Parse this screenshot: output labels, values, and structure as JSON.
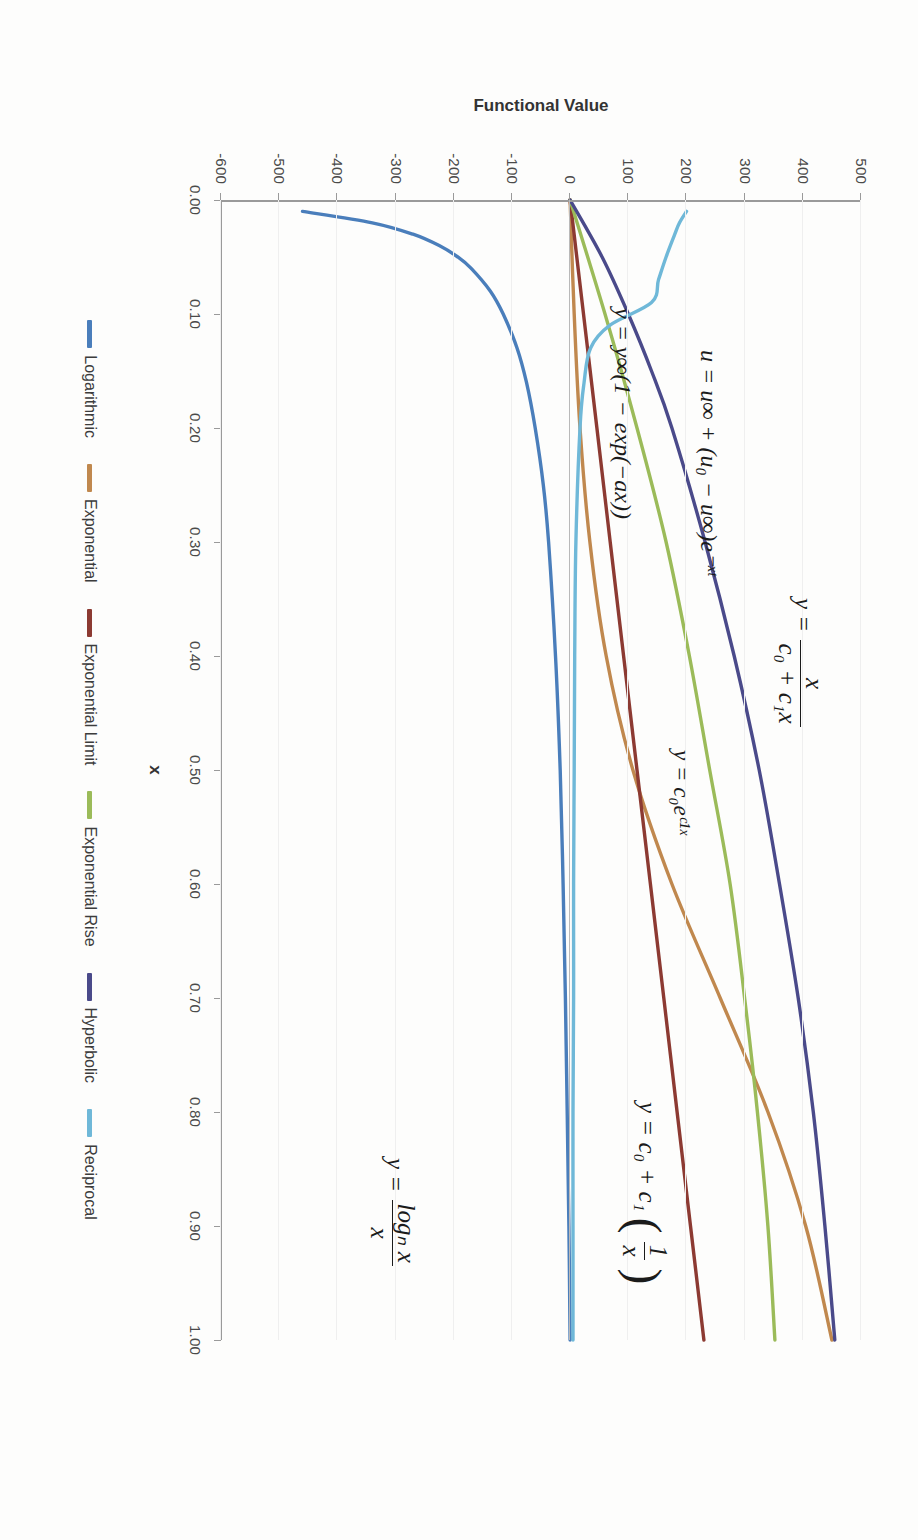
{
  "chart_data": {
    "type": "line",
    "title": "",
    "xlabel": "x",
    "ylabel": "Functional Value",
    "xlim": [
      0.0,
      1.0
    ],
    "ylim": [
      -600,
      500
    ],
    "xticks": [
      "0.00",
      "0.10",
      "0.20",
      "0.30",
      "0.40",
      "0.50",
      "0.60",
      "0.70",
      "0.80",
      "0.90",
      "1.00"
    ],
    "yticks": [
      "500",
      "400",
      "300",
      "200",
      "100",
      "0",
      "-100",
      "-200",
      "-300",
      "-400",
      "-500",
      "-600"
    ],
    "grid": true,
    "legend_position": "bottom",
    "series": [
      {
        "name": "Logarithmic",
        "color": "#4A7EBB",
        "equation": "y = log_n(x) / x",
        "x": [
          0.01,
          0.02,
          0.03,
          0.04,
          0.05,
          0.06,
          0.08,
          0.1,
          0.13,
          0.16,
          0.2,
          0.25,
          0.3,
          0.4,
          0.5,
          0.6,
          0.7,
          0.8,
          0.9,
          1.0
        ],
        "y": [
          -460,
          -340,
          -270,
          -225,
          -193,
          -170,
          -137,
          -115,
          -91,
          -75,
          -60,
          -46,
          -37,
          -25,
          -17,
          -12,
          -8,
          -5,
          -2,
          0
        ]
      },
      {
        "name": "Exponential",
        "color": "#C0884E",
        "equation": "y = c0 e^(c1 x)",
        "x": [
          0.0,
          0.1,
          0.2,
          0.3,
          0.4,
          0.5,
          0.6,
          0.7,
          0.8,
          0.9,
          1.0
        ],
        "y": [
          0,
          7,
          17,
          34,
          62,
          108,
          175,
          258,
          340,
          405,
          450
        ]
      },
      {
        "name": "Exponential Limit",
        "color": "#8C3A32",
        "equation": "y = y_inf (1 - exp(-a x))",
        "x": [
          0.0,
          0.1,
          0.2,
          0.3,
          0.4,
          0.5,
          0.6,
          0.7,
          0.8,
          0.9,
          1.0
        ],
        "y": [
          0,
          23,
          46,
          69,
          92,
          115,
          138,
          161,
          184,
          207,
          230
        ]
      },
      {
        "name": "Exponential Rise",
        "color": "#9BBB59",
        "equation": "u = u_inf + (u0 - u_inf) e^(-x tau)",
        "x": [
          0.0,
          0.1,
          0.2,
          0.3,
          0.4,
          0.5,
          0.6,
          0.7,
          0.8,
          0.9,
          1.0
        ],
        "y": [
          0,
          60,
          115,
          165,
          205,
          240,
          275,
          300,
          322,
          340,
          352
        ]
      },
      {
        "name": "Hyperbolic",
        "color": "#4A4A8A",
        "equation": "y = x / (c0 + c1 x)",
        "x": [
          0.0,
          0.05,
          0.1,
          0.15,
          0.2,
          0.3,
          0.4,
          0.5,
          0.6,
          0.7,
          0.8,
          0.9,
          1.0
        ],
        "y": [
          0,
          55,
          100,
          140,
          175,
          232,
          282,
          325,
          360,
          392,
          418,
          438,
          455
        ]
      },
      {
        "name": "Reciprocal",
        "color": "#6FB8D8",
        "equation": "y = c0 + c1 (1/x)",
        "x": [
          0.01,
          0.02,
          0.03,
          0.05,
          0.07,
          0.09,
          0.11,
          0.13,
          0.16,
          0.2,
          0.3,
          0.4,
          0.5,
          0.6,
          0.7,
          0.8,
          0.9,
          1.0
        ],
        "y": [
          200,
          188,
          180,
          165,
          152,
          140,
          68,
          35,
          24,
          17,
          10,
          8,
          7,
          6,
          6,
          5,
          5,
          5
        ]
      }
    ],
    "annotations": [
      {
        "id": "hyperbolic",
        "label": "y = x/(c0+c1x)"
      },
      {
        "id": "exponential-rise",
        "label": "u = u_inf + (u0-u_inf)e^(-x tau)"
      },
      {
        "id": "exponential-limit",
        "label": "y = y_inf(1-exp(-ax))"
      },
      {
        "id": "exponential",
        "label": "y = c0 e^(c1 x)"
      },
      {
        "id": "reciprocal",
        "label": "y = c0 + c1(1/x)"
      },
      {
        "id": "logarithmic",
        "label": "y = log_n x / x"
      }
    ]
  },
  "axes": {
    "x_title": "x",
    "y_title": "Functional Value",
    "x_ticks": [
      "0.00",
      "0.10",
      "0.20",
      "0.30",
      "0.40",
      "0.50",
      "0.60",
      "0.70",
      "0.80",
      "0.90",
      "1.00"
    ],
    "y_ticks": [
      "500",
      "400",
      "300",
      "200",
      "100",
      "0",
      "-100",
      "-200",
      "-300",
      "-400",
      "-500",
      "-600"
    ]
  },
  "legend": {
    "items": [
      {
        "label": "Logarithmic",
        "color": "#4A7EBB"
      },
      {
        "label": "Exponential",
        "color": "#C0884E"
      },
      {
        "label": "Exponential Limit",
        "color": "#8C3A32"
      },
      {
        "label": "Exponential Rise",
        "color": "#9BBB59"
      },
      {
        "label": "Hyperbolic",
        "color": "#4A4A8A"
      },
      {
        "label": "Reciprocal",
        "color": "#6FB8D8"
      }
    ]
  },
  "equations": {
    "hyperbolic": {
      "lhs": "y =",
      "num": "x",
      "den": "c₀ + c₁x"
    },
    "exponential_rise": {
      "text": "u = u∞ + (u₀ − u∞)e⁻ˣᵗ"
    },
    "exponential_limit": {
      "text": "y = y∞(1 − exp(−ax))"
    },
    "exponential": {
      "text": "y = c₀eᶜ¹ˣ"
    },
    "reciprocal": {
      "lhs": "y = c₀ + c₁",
      "num": "1",
      "den": "x"
    },
    "logarithmic": {
      "lhs": "y =",
      "num": "logₙ x",
      "den": "x"
    }
  }
}
